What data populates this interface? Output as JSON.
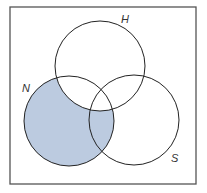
{
  "diagram": {
    "type": "venn",
    "shaded_region": "N minus H",
    "colors": {
      "shading": "#bccbe0",
      "outline": "#222222",
      "frame": "#555555",
      "background": "#ffffff"
    },
    "frame": {
      "x": 10,
      "y": 7,
      "width": 186,
      "height": 177
    },
    "sets": [
      {
        "id": "H",
        "label": "H",
        "cx": 100,
        "cy": 66,
        "r": 45,
        "label_x": 121,
        "label_y": 23
      },
      {
        "id": "N",
        "label": "N",
        "cx": 69,
        "cy": 121,
        "r": 45,
        "label_x": 22,
        "label_y": 92
      },
      {
        "id": "S",
        "label": "S",
        "cx": 134,
        "cy": 120,
        "r": 45,
        "label_x": 171,
        "label_y": 162
      }
    ]
  }
}
